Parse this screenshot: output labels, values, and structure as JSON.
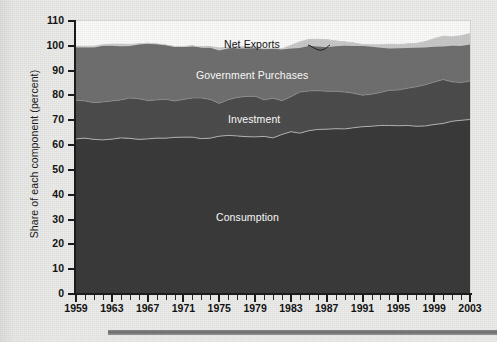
{
  "figure": {
    "background_color": "#e9e9e7",
    "plot_background_color": "#fbfbfa",
    "bottom_rule_color": "#7b7b7b"
  },
  "axes": {
    "y_title": "Share of each component (percent)",
    "y_ticks": [
      "0",
      "10",
      "20",
      "30",
      "40",
      "50",
      "60",
      "70",
      "80",
      "90",
      "100",
      "110"
    ],
    "x_ticks": [
      "1959",
      "1963",
      "1967",
      "1971",
      "1975",
      "1979",
      "1983",
      "1987",
      "1991",
      "1995",
      "1999",
      "2003"
    ]
  },
  "series_labels": {
    "net_exports": "Net Exports",
    "government_purchases": "Government Purchases",
    "investment": "Investment",
    "consumption": "Consumption"
  },
  "chart_data": {
    "type": "area",
    "title": "",
    "subtitle": "",
    "xlabel": "",
    "ylabel": "Share of each component (percent)",
    "xlim": [
      1959,
      2003
    ],
    "ylim": [
      0,
      110
    ],
    "ytick_step": 10,
    "xtick_step": 4,
    "x_minor_tick_step": 1,
    "grid": false,
    "legend": "inline-labels",
    "stacked": true,
    "colors": {
      "Consumption": "#3b3b3b",
      "Investment": "#4d4d4d",
      "Government Purchases": "#707070",
      "Net Exports": "#c9c9c9"
    },
    "x": [
      1959,
      1960,
      1961,
      1962,
      1963,
      1964,
      1965,
      1966,
      1967,
      1968,
      1969,
      1970,
      1971,
      1972,
      1973,
      1974,
      1975,
      1976,
      1977,
      1978,
      1979,
      1980,
      1981,
      1982,
      1983,
      1984,
      1985,
      1986,
      1987,
      1988,
      1989,
      1990,
      1991,
      1992,
      1993,
      1994,
      1995,
      1996,
      1997,
      1998,
      1999,
      2000,
      2001,
      2002,
      2003
    ],
    "series": [
      {
        "name": "Consumption",
        "values": [
          62.5,
          62.8,
          62.3,
          62.1,
          62.4,
          62.9,
          62.7,
          62.3,
          62.5,
          62.8,
          62.8,
          63.1,
          63.2,
          63.2,
          62.6,
          62.8,
          63.6,
          63.9,
          63.7,
          63.4,
          63.3,
          63.5,
          62.9,
          64.3,
          65.4,
          64.8,
          65.8,
          66.3,
          66.4,
          66.6,
          66.5,
          67.0,
          67.4,
          67.6,
          67.9,
          67.9,
          67.8,
          67.9,
          67.6,
          67.7,
          68.3,
          68.7,
          69.6,
          70.0,
          70.3
        ]
      },
      {
        "name": "Investment",
        "values": [
          15.6,
          15.0,
          14.8,
          15.3,
          15.4,
          15.3,
          16.3,
          16.4,
          15.5,
          15.4,
          15.7,
          14.7,
          15.2,
          15.8,
          16.4,
          15.6,
          13.2,
          14.4,
          15.5,
          16.2,
          16.4,
          14.7,
          16.0,
          13.6,
          14.1,
          16.6,
          16.0,
          15.6,
          15.3,
          15.1,
          14.9,
          13.9,
          12.7,
          12.9,
          13.3,
          14.2,
          14.4,
          15.0,
          15.9,
          16.6,
          17.1,
          17.7,
          15.9,
          15.2,
          15.5
        ]
      },
      {
        "name": "Government Purchases",
        "values": [
          21.4,
          21.7,
          22.4,
          22.8,
          22.4,
          21.8,
          21.1,
          22.0,
          23.0,
          22.6,
          21.9,
          21.9,
          21.3,
          21.1,
          20.4,
          21.0,
          21.5,
          20.8,
          20.5,
          20.1,
          19.9,
          20.6,
          20.1,
          20.9,
          20.7,
          20.2,
          20.8,
          20.8,
          20.8,
          20.3,
          20.2,
          20.3,
          20.4,
          19.9,
          19.2,
          18.6,
          18.3,
          17.9,
          17.5,
          17.4,
          17.5,
          17.5,
          18.2,
          18.9,
          19.2
        ]
      },
      {
        "name": "Net Exports",
        "values": [
          0.5,
          0.5,
          0.5,
          0.4,
          0.6,
          0.8,
          0.6,
          0.3,
          0.2,
          0.0,
          0.0,
          0.2,
          -0.2,
          -0.4,
          0.5,
          0.5,
          1.0,
          0.5,
          -0.8,
          -0.8,
          -0.6,
          0.0,
          -0.1,
          -0.3,
          -1.3,
          -2.5,
          -2.7,
          -3.0,
          -3.1,
          -2.2,
          -1.6,
          -1.3,
          -0.6,
          -0.8,
          -1.2,
          -1.8,
          -1.5,
          -1.7,
          -1.8,
          -2.4,
          -3.3,
          -4.2,
          -3.7,
          -4.2,
          -4.5
        ]
      }
    ],
    "annotation": {
      "text": "Net Exports",
      "leader": "curved line pointing down-right to the thin Net Exports band"
    }
  }
}
